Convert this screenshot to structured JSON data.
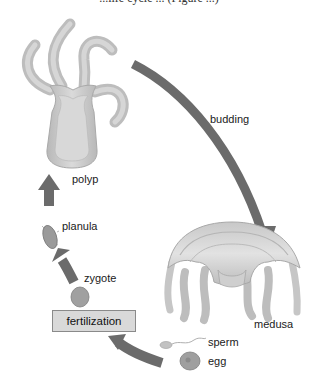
{
  "caption": {
    "partial_text": "...life cycle ... (Figure ...)"
  },
  "labels": {
    "polyp": "polyp",
    "budding": "budding",
    "medusa": "medusa",
    "sperm": "sperm",
    "egg": "egg",
    "fertilization": "fertilization",
    "zygote": "zygote",
    "planula": "planula"
  },
  "colors": {
    "arrow": "#6b6b6b",
    "organism_fill": "#c4c4c4",
    "organism_light": "#dcdcdc",
    "box_fill": "#d9d9d9",
    "text": "#1a1a1a"
  },
  "cycle_order": [
    "polyp",
    "budding",
    "medusa",
    "sperm",
    "egg",
    "fertilization",
    "zygote",
    "planula",
    "polyp"
  ]
}
